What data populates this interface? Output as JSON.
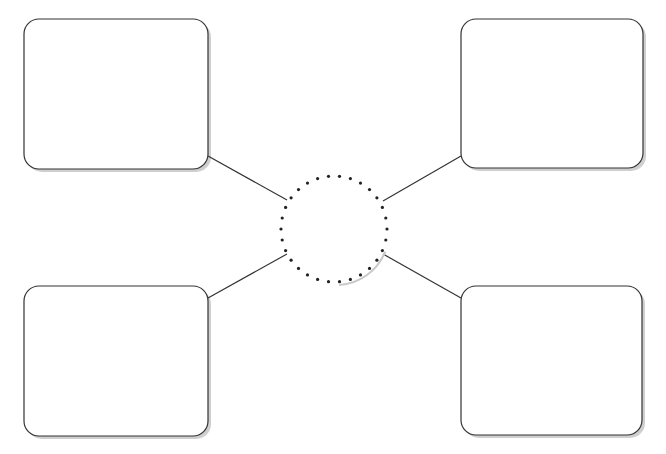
{
  "diagram": {
    "type": "concept-web",
    "center": {
      "cx": 334,
      "cy": 229,
      "r": 53,
      "style": "dotted",
      "label": ""
    },
    "boxes": [
      {
        "id": "top-left",
        "x": 24,
        "y": 19,
        "w": 184,
        "h": 150,
        "label": ""
      },
      {
        "id": "top-right",
        "x": 461,
        "y": 19,
        "w": 182,
        "h": 149,
        "label": ""
      },
      {
        "id": "bottom-left",
        "x": 24,
        "y": 286,
        "w": 184,
        "h": 150,
        "label": ""
      },
      {
        "id": "bottom-right",
        "x": 461,
        "y": 286,
        "w": 181,
        "h": 149,
        "label": ""
      }
    ],
    "connectors": [
      {
        "from": "top-left",
        "x1": 208,
        "y1": 156,
        "x2": 287,
        "y2": 200
      },
      {
        "from": "top-right",
        "x1": 461,
        "y1": 156,
        "x2": 383,
        "y2": 201
      },
      {
        "from": "bottom-left",
        "x1": 208,
        "y1": 298,
        "x2": 287,
        "y2": 254
      },
      {
        "from": "bottom-right",
        "x1": 461,
        "y1": 298,
        "x2": 383,
        "y2": 254
      }
    ],
    "colors": {
      "stroke": "#333333",
      "shadow": "#bbbbbb",
      "dot": "#222222",
      "fill": "#ffffff"
    }
  }
}
